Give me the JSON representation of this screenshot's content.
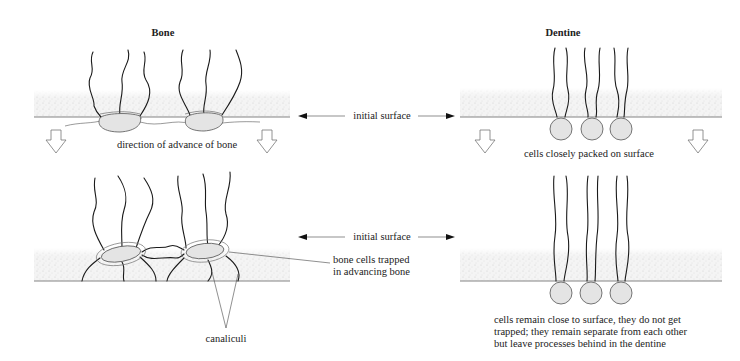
{
  "titles": {
    "bone": "Bone",
    "dentine": "Dentine"
  },
  "labels": {
    "initial_surface_top": "initial surface",
    "initial_surface_bottom": "initial surface",
    "direction_of_advance": "direction of advance of bone",
    "cells_closely_packed": "cells closely packed on surface",
    "bone_cells_trapped": [
      "bone cells trapped",
      "in advancing bone"
    ],
    "canaliculi": "canaliculi",
    "dentine_note": [
      "cells remain close to surface, they do not get",
      "trapped; they remain separate from each other",
      "but leave processes behind in the dentine"
    ]
  },
  "panels": [
    {
      "id": "bone-stage-1",
      "tissue": "Bone",
      "stage": "initial"
    },
    {
      "id": "dentine-stage-1",
      "tissue": "Dentine",
      "stage": "initial"
    },
    {
      "id": "bone-stage-2",
      "tissue": "Bone",
      "stage": "advanced"
    },
    {
      "id": "dentine-stage-2",
      "tissue": "Dentine",
      "stage": "advanced"
    }
  ]
}
